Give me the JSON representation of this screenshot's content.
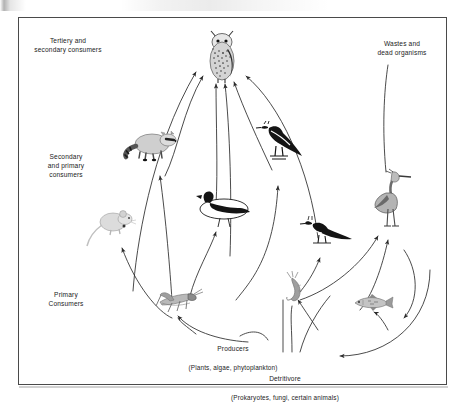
{
  "diagram": {
    "type": "food-web",
    "labels": {
      "tertiary": "Tertiery and\nsecondary consumers",
      "secondary": "Secondary\nand primary\nconsumers",
      "primary": "Primary\nConsumers",
      "wastes": "Wastes and\ndead organisms",
      "producers_main": "Producers",
      "producers_sub": "(Plants, algae, phytoplankton)",
      "detritivore_main": "Detritivore",
      "detritivore_sub": "(Prokaryotes, fungi, certain animals)"
    },
    "organisms": [
      {
        "name": "owl",
        "level": "tertiary",
        "x": 222,
        "y": 57
      },
      {
        "name": "raccoon",
        "level": "secondary",
        "x": 152,
        "y": 144
      },
      {
        "name": "magpie",
        "level": "secondary",
        "x": 282,
        "y": 143
      },
      {
        "name": "heron",
        "level": "secondary",
        "x": 389,
        "y": 200
      },
      {
        "name": "duck",
        "level": "secondary",
        "x": 224,
        "y": 208
      },
      {
        "name": "mouse",
        "level": "primary",
        "x": 115,
        "y": 224
      },
      {
        "name": "songbird",
        "level": "primary",
        "x": 327,
        "y": 234
      },
      {
        "name": "grasshopper",
        "level": "primary",
        "x": 174,
        "y": 301
      },
      {
        "name": "shrimp",
        "level": "primary",
        "x": 297,
        "y": 290
      },
      {
        "name": "fish",
        "level": "primary",
        "x": 372,
        "y": 305
      }
    ],
    "colors": {
      "frame_border": "#4a4a4a",
      "arrow_stroke": "#2b2b2b",
      "text": "#1b1b1b",
      "background": "#ffffff",
      "ink_dark": "#151515",
      "ink_mid": "#808080",
      "ink_light": "#c9c9c9"
    },
    "arrow_count": 22
  }
}
